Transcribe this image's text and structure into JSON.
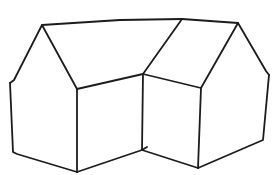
{
  "image": {
    "subject": "line drawing of two adjoining house shapes",
    "background_color": "#ffffff",
    "stroke_color": "#1c1c1c"
  },
  "vertices": {
    "left_peak": [
      42,
      25
    ],
    "middle_peak": [
      182,
      19
    ],
    "right_peak": [
      238,
      23
    ],
    "left_eave": [
      10,
      83
    ],
    "left_base": [
      14,
      155
    ],
    "left_front_top": [
      77,
      89
    ],
    "left_front_bottom": [
      77,
      172
    ],
    "valley_top": [
      143,
      74
    ],
    "valley_bottom": [
      142,
      150
    ],
    "right_front_top": [
      201,
      88
    ],
    "right_front_bottom": [
      198,
      168
    ],
    "right_eave": [
      269,
      75
    ],
    "right_base": [
      263,
      140
    ]
  }
}
